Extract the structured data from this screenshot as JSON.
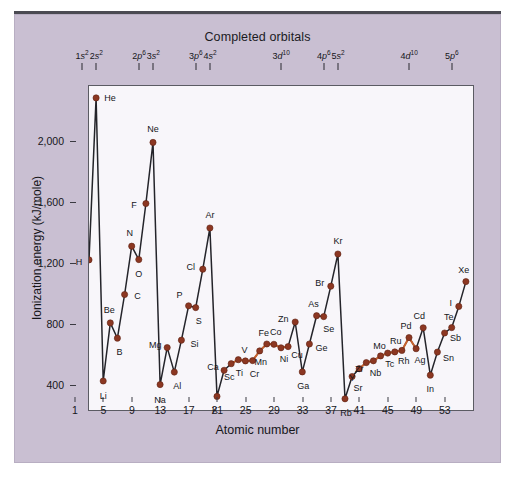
{
  "chart_data": {
    "type": "line",
    "title": "Completed orbitals",
    "xlabel": "Atomic number",
    "ylabel": "Ionization energy (kJ/mole)",
    "xlim": [
      1,
      55
    ],
    "ylim": [
      330,
      2450
    ],
    "xticks": [
      1,
      5,
      9,
      13,
      17,
      21,
      25,
      29,
      33,
      37,
      41,
      45,
      49,
      53
    ],
    "yticks": [
      400,
      800,
      1200,
      1600,
      2000
    ],
    "ytick_labels": [
      "400",
      "800",
      "1,200",
      "1,600",
      "2,000"
    ],
    "grid": false,
    "legend": false,
    "series": [
      {
        "name": "Ionization energy",
        "point_color": "#8c3722",
        "line_color": "#24242a",
        "transition_line_color": "#c8622e",
        "x": [
          1,
          2,
          3,
          4,
          5,
          6,
          7,
          8,
          9,
          10,
          11,
          12,
          13,
          14,
          15,
          16,
          17,
          18,
          19,
          20,
          21,
          22,
          23,
          24,
          25,
          26,
          27,
          28,
          29,
          30,
          31,
          32,
          33,
          34,
          35,
          36,
          37,
          38,
          39,
          40,
          41,
          42,
          43,
          44,
          45,
          46,
          47,
          48,
          49,
          50,
          51,
          52,
          53,
          54
        ],
        "values": [
          1312,
          2372,
          520,
          900,
          800,
          1086,
          1402,
          1314,
          1681,
          2081,
          496,
          738,
          578,
          787,
          1012,
          1000,
          1251,
          1521,
          419,
          590,
          633,
          659,
          651,
          653,
          717,
          762,
          760,
          737,
          745,
          906,
          579,
          762,
          947,
          941,
          1140,
          1351,
          403,
          549,
          600,
          640,
          652,
          684,
          702,
          710,
          720,
          804,
          731,
          868,
          558,
          709,
          834,
          869,
          1008,
          1170
        ],
        "labels": [
          "H",
          "He",
          "Li",
          "Be",
          "B",
          "C",
          "N",
          "O",
          "F",
          "Ne",
          "Na",
          "Mg",
          "Al",
          "Si",
          "P",
          "S",
          "Cl",
          "Ar",
          "K",
          "Ca",
          "Sc",
          "Ti",
          "V",
          "Cr",
          "Mn",
          "Fe",
          "Co",
          "Ni",
          "Cu",
          "Zn",
          "Ga",
          "Ge",
          "As",
          "Se",
          "Br",
          "Kr",
          "Rb",
          "Sr",
          "Y",
          "Zr",
          "Nb",
          "Mo",
          "Tc",
          "Ru",
          "Rh",
          "Pd",
          "Ag",
          "Cd",
          "In",
          "Sn",
          "Sb",
          "Te",
          "I",
          "Xe"
        ]
      }
    ],
    "annotations": [
      {
        "text": "1s²  2s²",
        "atomic_numbers": [
          2,
          4
        ]
      },
      {
        "text": "2p⁶ 3s²",
        "atomic_numbers": [
          10,
          12
        ]
      },
      {
        "text": "3p⁶ 4s²",
        "atomic_numbers": [
          18,
          20
        ]
      },
      {
        "text": "3d¹⁰",
        "atomic_numbers": [
          30
        ]
      },
      {
        "text": "4p⁶ 5s²",
        "atomic_numbers": [
          36,
          38
        ]
      },
      {
        "text": "4d¹⁰",
        "atomic_numbers": [
          48
        ]
      },
      {
        "text": "5p⁶",
        "atomic_numbers": [
          54
        ]
      }
    ],
    "top_axis_marks": [
      {
        "id": "1s2",
        "n": "1",
        "orb": "s",
        "sup": "2",
        "z": 2
      },
      {
        "id": "2s2",
        "n": "2",
        "orb": "s",
        "sup": "2",
        "z": 4
      },
      {
        "id": "2p6",
        "n": "2",
        "orb": "p",
        "sup": "6",
        "z": 10
      },
      {
        "id": "3s2",
        "n": "3",
        "orb": "s",
        "sup": "2",
        "z": 12
      },
      {
        "id": "3p6",
        "n": "3",
        "orb": "p",
        "sup": "6",
        "z": 18
      },
      {
        "id": "4s2",
        "n": "4",
        "orb": "s",
        "sup": "2",
        "z": 20
      },
      {
        "id": "3d10",
        "n": "3",
        "orb": "d",
        "sup": "10",
        "z": 30
      },
      {
        "id": "4p6",
        "n": "4",
        "orb": "p",
        "sup": "6",
        "z": 36
      },
      {
        "id": "5s2",
        "n": "5",
        "orb": "s",
        "sup": "2",
        "z": 38
      },
      {
        "id": "4d10",
        "n": "4",
        "orb": "d",
        "sup": "10",
        "z": 48
      },
      {
        "id": "5p6",
        "n": "5",
        "orb": "p",
        "sup": "6",
        "z": 54
      }
    ],
    "transition_segment_1": [
      21,
      22,
      23,
      24,
      25,
      26,
      27,
      28,
      29
    ],
    "transition_segment_2": [
      39,
      40,
      41,
      42,
      43,
      44,
      45,
      46,
      47
    ],
    "label_offsets": {
      "H": [
        -10,
        2
      ],
      "He": [
        14,
        0
      ],
      "Li": [
        0,
        15
      ],
      "Be": [
        -1,
        -13
      ],
      "B": [
        2,
        14
      ],
      "C": [
        13,
        2
      ],
      "N": [
        -2,
        -13
      ],
      "O": [
        0,
        14
      ],
      "F": [
        -12,
        1
      ],
      "Ne": [
        0,
        -13
      ],
      "Na": [
        0,
        15
      ],
      "Mg": [
        -12,
        -3
      ],
      "Al": [
        3,
        14
      ],
      "Si": [
        13,
        4
      ],
      "P": [
        -9,
        -11
      ],
      "S": [
        3,
        13
      ],
      "Cl": [
        -12,
        -2
      ],
      "Ar": [
        0,
        -13
      ],
      "K": [
        -2,
        14
      ],
      "Ca": [
        -11,
        -3
      ],
      "Sc": [
        -2,
        13
      ],
      "Ti": [
        1,
        13
      ],
      "V": [
        -1,
        -11
      ],
      "Cr": [
        2,
        13
      ],
      "Mn": [
        1,
        11
      ],
      "Fe": [
        -3,
        -11
      ],
      "Co": [
        2,
        -12
      ],
      "Ni": [
        3,
        11
      ],
      "Cu": [
        9,
        8
      ],
      "Zn": [
        -12,
        -3
      ],
      "Ga": [
        1,
        14
      ],
      "Ge": [
        12,
        4
      ],
      "As": [
        -3,
        -12
      ],
      "Se": [
        5,
        12
      ],
      "Br": [
        -11,
        -3
      ],
      "Kr": [
        0,
        -13
      ],
      "Rb": [
        1,
        14
      ],
      "Sr": [
        6,
        11
      ],
      "Y": [
        -7,
        9
      ],
      "Zr": [
        -7,
        6
      ],
      "Nb": [
        2,
        12
      ],
      "Mo": [
        -1,
        -10
      ],
      "Tc": [
        2,
        11
      ],
      "Ru": [
        1,
        -11
      ],
      "Rh": [
        2,
        11
      ],
      "Pd": [
        -3,
        -12
      ],
      "Ag": [
        4,
        11
      ],
      "Cd": [
        -4,
        -12
      ],
      "In": [
        0,
        14
      ],
      "Sn": [
        11,
        6
      ],
      "Sb": [
        11,
        5
      ],
      "Te": [
        -3,
        -11
      ],
      "I": [
        -8,
        -3
      ],
      "Xe": [
        -2,
        -12
      ]
    }
  }
}
